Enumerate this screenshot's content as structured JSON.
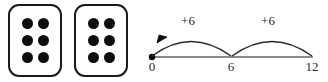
{
  "diagram": {
    "dice": {
      "card_count": 2,
      "pips_per_card": 6,
      "cards": [
        {
          "name": "card-1",
          "pips": 6
        },
        {
          "name": "card-2",
          "pips": 6
        }
      ],
      "pip_color": "#0d0d0d",
      "card_border_color": "#1a1a1a",
      "card_fill_color": "#ffffff"
    },
    "number_line": {
      "axis_color": "#8c8c8c",
      "arc_color": "#2b2b2b",
      "start_dot_color": "#0d0d0d",
      "ticks": [
        {
          "label": "0",
          "value": 0
        },
        {
          "label": "6",
          "value": 6
        },
        {
          "label": "12",
          "value": 12
        }
      ],
      "jumps": [
        {
          "label": "+6",
          "from": 0,
          "to": 6
        },
        {
          "label": "+6",
          "from": 6,
          "to": 12
        }
      ]
    }
  }
}
